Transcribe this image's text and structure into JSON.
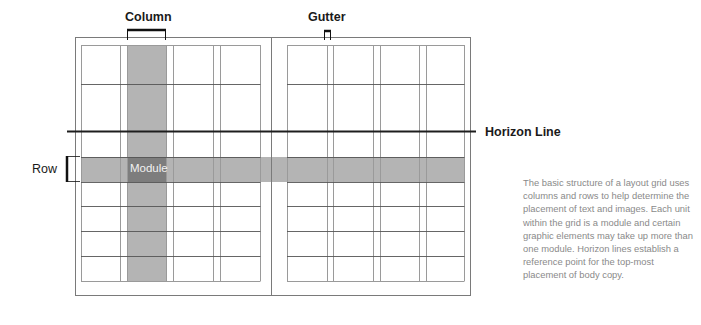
{
  "diagram": {
    "labels": {
      "column": "Column",
      "gutter": "Gutter",
      "horizon_line": "Horizon Line",
      "row": "Row",
      "module": "Module"
    },
    "description": "The basic structure of a layout grid uses columns and rows to help determine the placement of text and images. Each unit within the grid is a module and certain graphic elements may take up more than one module. Horizon lines establish a reference point for the top-most placement of body copy.",
    "grid": {
      "pages": 2,
      "columns_per_page": 4,
      "rows": [
        "row-1",
        "row-2",
        "row-3",
        "row-4",
        "row-5",
        "row-6",
        "row-7"
      ],
      "highlighted_column_index": 1,
      "highlighted_row_index": 2,
      "module_cell": {
        "column": 1,
        "row": 2
      }
    },
    "colors": {
      "line": "#9a9a9a",
      "dark_line": "#2b2b2b",
      "highlight": "#b4b4b4",
      "module": "#7a7a7a",
      "text": "#1a1a1a",
      "description_text": "#8a8a8a"
    }
  }
}
